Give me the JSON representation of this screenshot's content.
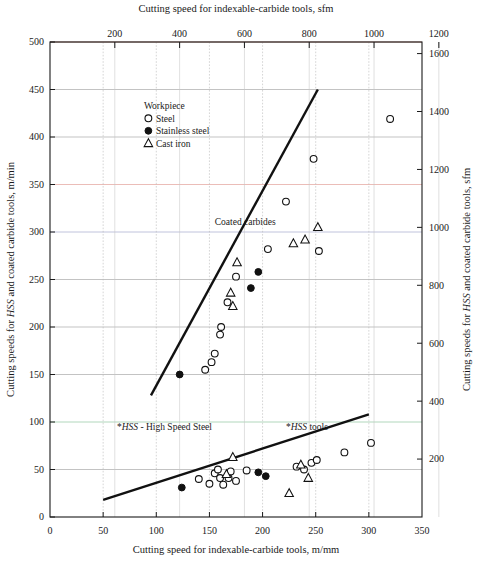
{
  "chart_data": {
    "type": "scatter",
    "title": "",
    "top_axis": {
      "label": "Cutting speed for indexable-carbide tools, sfm",
      "ticks": [
        200,
        400,
        600,
        800,
        1000,
        1200
      ],
      "lim": [
        0,
        1148
      ]
    },
    "bottom_axis": {
      "label": "Cutting speed for indexable-carbide tools, m/mm",
      "ticks": [
        0,
        50,
        100,
        150,
        200,
        250,
        300,
        350
      ],
      "lim": [
        0,
        350
      ]
    },
    "left_axis": {
      "label": "Cutting speeds for HSS and coated carbide tools, m/min",
      "label_italic_part": "HSS",
      "ticks": [
        0,
        50,
        100,
        150,
        200,
        250,
        300,
        350,
        400,
        450,
        500
      ],
      "lim": [
        0,
        500
      ]
    },
    "right_axis": {
      "label": "Cutting speeds for HSS and coated carbide tools, sfm",
      "label_italic_part": "HSS",
      "ticks": [
        200,
        400,
        600,
        800,
        1000,
        1200,
        1400,
        1600
      ],
      "lim": [
        0,
        1640
      ]
    },
    "grid": true,
    "legend": {
      "title": "Workpiece",
      "position": "upper-left-inside",
      "entries": [
        {
          "marker": "open-circle",
          "label": "Steel"
        },
        {
          "marker": "filled-circle",
          "label": "Stainless steel"
        },
        {
          "marker": "triangle",
          "label": "Cast iron"
        }
      ]
    },
    "annotations": [
      {
        "text": "Coated carbides",
        "x": 155,
        "y": 307
      },
      {
        "text": "*HSS tools",
        "x": 222,
        "y": 92,
        "italic_part": "HSS"
      },
      {
        "text": "*HSS - High Speed Steel",
        "x": 63,
        "y": 92,
        "italic_part": "HSS"
      }
    ],
    "trend_lines": [
      {
        "name": "coated-carbides-trend",
        "x": [
          95,
          252
        ],
        "y": [
          128,
          450
        ]
      },
      {
        "name": "hss-trend",
        "x": [
          50,
          300
        ],
        "y": [
          18,
          108
        ]
      }
    ],
    "series": [
      {
        "name": "Steel",
        "marker": "open-circle",
        "points": [
          [
            146,
            155
          ],
          [
            152,
            163
          ],
          [
            155,
            172
          ],
          [
            160,
            192
          ],
          [
            161,
            200
          ],
          [
            167,
            226
          ],
          [
            175,
            253
          ],
          [
            205,
            282
          ],
          [
            222,
            332
          ],
          [
            248,
            377
          ],
          [
            253,
            280
          ],
          [
            320,
            419
          ],
          [
            140,
            40
          ],
          [
            150,
            35
          ],
          [
            155,
            46
          ],
          [
            158,
            50
          ],
          [
            160,
            41
          ],
          [
            163,
            34
          ],
          [
            168,
            41
          ],
          [
            170,
            48
          ],
          [
            175,
            38
          ],
          [
            185,
            49
          ],
          [
            232,
            53
          ],
          [
            239,
            50
          ],
          [
            246,
            57
          ],
          [
            251,
            60
          ],
          [
            277,
            68
          ],
          [
            302,
            78
          ]
        ]
      },
      {
        "name": "Stainless steel",
        "marker": "filled-circle",
        "points": [
          [
            122,
            150
          ],
          [
            189,
            241
          ],
          [
            196,
            258
          ],
          [
            124,
            31
          ],
          [
            196,
            47
          ],
          [
            203,
            43
          ]
        ]
      },
      {
        "name": "Cast iron",
        "marker": "triangle",
        "points": [
          [
            170,
            236
          ],
          [
            172,
            222
          ],
          [
            176,
            268
          ],
          [
            229,
            288
          ],
          [
            240,
            292
          ],
          [
            252,
            305
          ],
          [
            166,
            45
          ],
          [
            172,
            63
          ],
          [
            236,
            55
          ],
          [
            243,
            41
          ],
          [
            225,
            25
          ]
        ]
      }
    ]
  }
}
